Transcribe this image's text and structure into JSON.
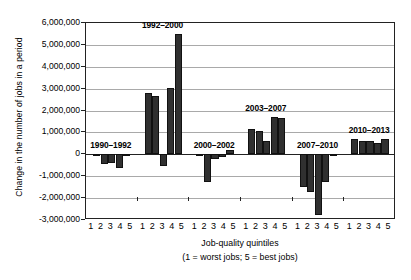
{
  "chart_data": {
    "type": "bar",
    "title": "",
    "xlabel": "Job-quality quintiles",
    "xlabel_note": "(1 = worst jobs; 5 = best jobs)",
    "ylabel": "Change in the number of jobs in a period",
    "ylim": [
      -3000000,
      6000000
    ],
    "ytick_values": [
      6000000,
      5000000,
      4000000,
      3000000,
      2000000,
      1000000,
      0,
      -1000000,
      -2000000,
      -3000000
    ],
    "ytick_labels": [
      "6,000,000",
      "5,000,000",
      "4,000,000",
      "3,000,000",
      "2,000,000",
      "1,000,000",
      "0",
      "-1,000,000",
      "-2,000,000",
      "-3,000,000"
    ],
    "grid": true,
    "legend": "none",
    "categories": [
      "1",
      "2",
      "3",
      "4",
      "5"
    ],
    "category_label": "1 2 3 4 5",
    "bar_color": "#303030",
    "groups": [
      {
        "name": "1990-1992",
        "label": "1990–1992",
        "values": [
          -60000,
          -450000,
          -380000,
          -620000,
          -60000
        ]
      },
      {
        "name": "1992-2000",
        "label": "1992–2000",
        "values": [
          2820000,
          2650000,
          -530000,
          3050000,
          5500000
        ]
      },
      {
        "name": "2000-2002",
        "label": "2000–2002",
        "values": [
          -70000,
          -1250000,
          -230000,
          -100000,
          180000
        ]
      },
      {
        "name": "2003-2007",
        "label": "2003–2007",
        "values": [
          1140000,
          1060000,
          600000,
          1700000,
          1650000
        ]
      },
      {
        "name": "2007-2010",
        "label": "2007–2010",
        "values": [
          -1480000,
          -1700000,
          -2780000,
          -1270000,
          -80000
        ]
      },
      {
        "name": "2010-2013",
        "label": "2010–2013",
        "values": [
          700000,
          600000,
          590000,
          540000,
          690000
        ]
      }
    ]
  }
}
